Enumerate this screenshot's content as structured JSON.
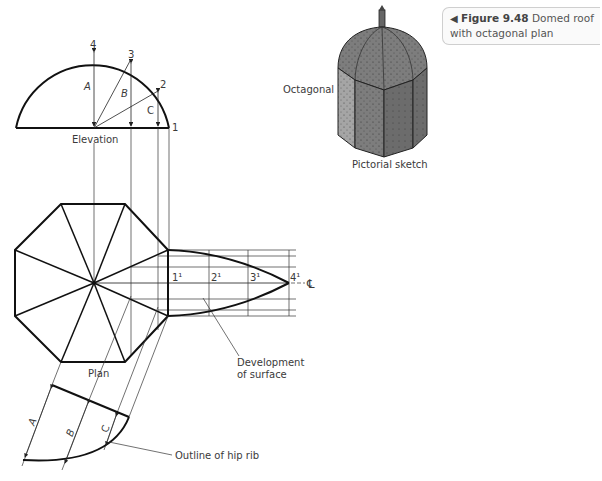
{
  "caption": {
    "arrow_icon": "◀",
    "figure_number": "Figure 9.48",
    "text": "Domed roof with octagonal plan"
  },
  "elevation": {
    "title": "Elevation",
    "points": [
      "1",
      "2",
      "3",
      "4"
    ],
    "heights": [
      "A",
      "B",
      "C"
    ]
  },
  "plan": {
    "title": "Plan"
  },
  "development": {
    "points": [
      "1¹",
      "2¹",
      "3¹",
      "4¹"
    ],
    "centerline_symbol": "℄",
    "label_line1": "Development",
    "label_line2": "of surface"
  },
  "hip_rib": {
    "heights": [
      "A",
      "B",
      "C"
    ],
    "label": "Outline of hip rib"
  },
  "pictorial": {
    "side_label": "Octagonal",
    "caption": "Pictorial sketch"
  }
}
